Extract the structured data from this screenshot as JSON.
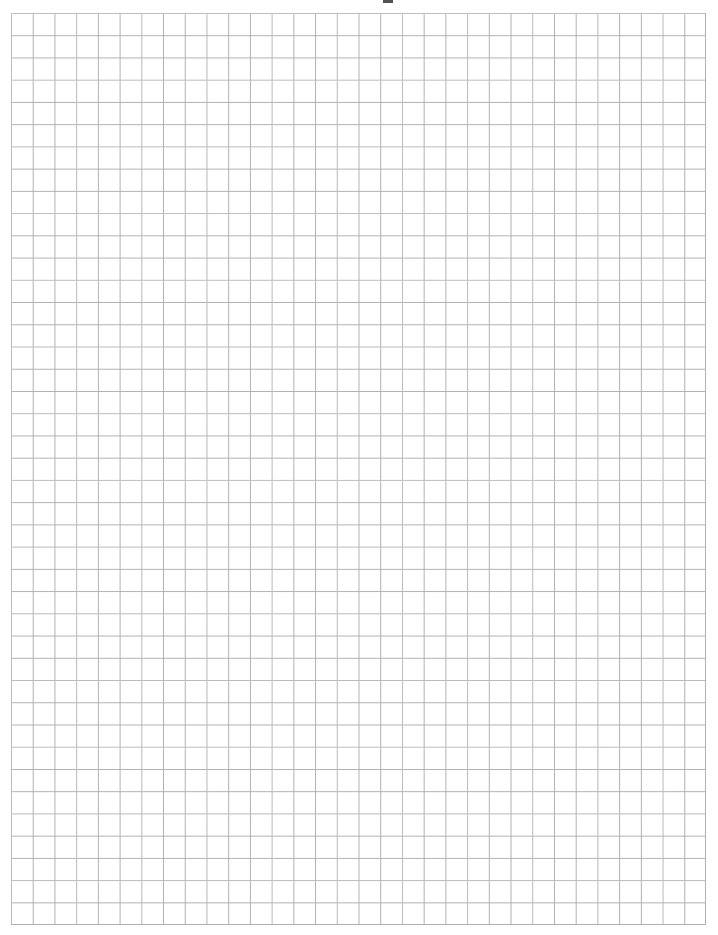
{
  "document": {
    "kind": "graph-paper-sheet",
    "page_width_px": 718,
    "page_height_px": 935,
    "background_color": "#ffffff",
    "description": "Blank printable square-grid graph paper with no printed text, labels or numbers."
  },
  "grid": {
    "origin_x_px": 11,
    "origin_y_px": 13,
    "width_px": 695,
    "height_px": 912,
    "columns": 32,
    "rows": 41,
    "cell_width_px": 21.72,
    "cell_height_px": 22.24,
    "line_color": "#b0b0b0",
    "line_width_px": 1,
    "has_major_gridlines": false,
    "has_axis_labels": false
  },
  "margins": {
    "top_px": 13,
    "left_px": 11,
    "right_px": 12,
    "bottom_px": 10
  },
  "artifacts": [
    {
      "name": "top-edge-scan-mark",
      "x_px": 383,
      "y_px": 0,
      "width_px": 10,
      "height_px": 3,
      "color": "#2b2b2b"
    }
  ],
  "chart_data": {
    "type": "table",
    "title": "",
    "subtitle": "",
    "xlabel": "",
    "ylabel": "",
    "categories": [],
    "values": [],
    "series": [],
    "grid": true,
    "legend": "none",
    "annotations": [],
    "note": "Empty grid — no plotted data, tick labels or legend present in the image."
  }
}
